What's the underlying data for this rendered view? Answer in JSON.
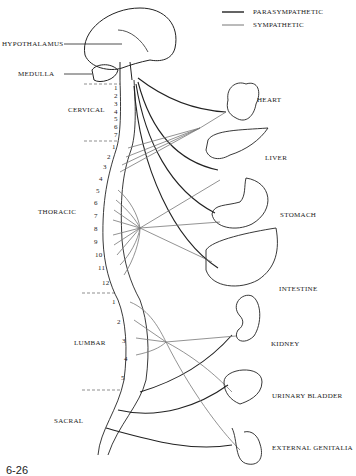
{
  "legend": {
    "parasympathetic": "PARASYMPATHETIC",
    "sympathetic": "SYMPATHETIC"
  },
  "brain_labels": {
    "hypothalamus": "HYPOTHALAMUS",
    "medulla": "MEDULLA"
  },
  "regions": {
    "cervical": "CERVICAL",
    "thoracic": "THORACIC",
    "lumbar": "LUMBAR",
    "sacral": "SACRAL"
  },
  "vertebrae": {
    "cervical": [
      "1",
      "2",
      "3",
      "4",
      "5",
      "6",
      "7"
    ],
    "thoracic": [
      "1",
      "2",
      "3",
      "4",
      "5",
      "6",
      "7",
      "8",
      "9",
      "10",
      "11",
      "12"
    ],
    "lumbar": [
      "1",
      "2",
      "3",
      "4",
      "5"
    ]
  },
  "organs": {
    "heart": "HEART",
    "liver": "LIVER",
    "stomach": "STOMACH",
    "intestine": "INTESTINE",
    "kidney": "KIDNEY",
    "urinary_bladder": "URINARY BLADDER",
    "external_genitalia": "EXTERNAL GENITALIA"
  },
  "figure_number": "6-26",
  "colors": {
    "parasympathetic": "#222222",
    "sympathetic": "#777777"
  }
}
